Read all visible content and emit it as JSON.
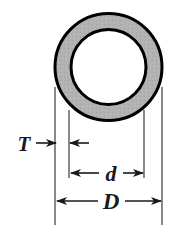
{
  "figure": {
    "background_color": "#ffffff"
  },
  "shape": {
    "name": "annulus",
    "fill_color": "#b2b2b2",
    "stroke_color": "#000000",
    "outer_circle": {
      "cx": 108.5,
      "cy": 67,
      "r": 53.5,
      "stroke_width": 3
    },
    "inner_circle": {
      "cx": 108.5,
      "cy": 67,
      "r": 37.5,
      "stroke_width": 3
    }
  },
  "dimensions": [
    {
      "id": "thickness",
      "label": "T",
      "meaning": "wall thickness",
      "label_x": 24,
      "label_y": 150,
      "line_y": 143,
      "from_x": 55,
      "to_x": 70,
      "arrow_style": "outside-arrows"
    },
    {
      "id": "inner-diameter",
      "label": "d",
      "meaning": "inner diameter",
      "label_x": 111,
      "label_y": 180,
      "line_y": 173,
      "from_x": 69,
      "to_x": 144,
      "arrow_style": "inside-arrows"
    },
    {
      "id": "outer-diameter",
      "label": "D",
      "meaning": "outer diameter",
      "label_x": 111,
      "label_y": 208,
      "line_y": 201,
      "from_x": 55,
      "to_x": 162,
      "arrow_style": "inside-arrows"
    }
  ],
  "extension_lines": [
    {
      "id": "ext-outer-left",
      "x": 55,
      "y1": 87,
      "y2": 225
    },
    {
      "id": "ext-outer-right",
      "x": 162,
      "y1": 87,
      "y2": 225
    },
    {
      "id": "ext-inner-left",
      "x": 69,
      "y1": 110,
      "y2": 178
    },
    {
      "id": "ext-inner-right",
      "x": 144,
      "y1": 110,
      "y2": 178
    }
  ],
  "colors": {
    "ink": "#1a1a1a",
    "rule": "#3a3a3a",
    "metal_gray": "#b2b2b2",
    "page": "#ffffff"
  }
}
